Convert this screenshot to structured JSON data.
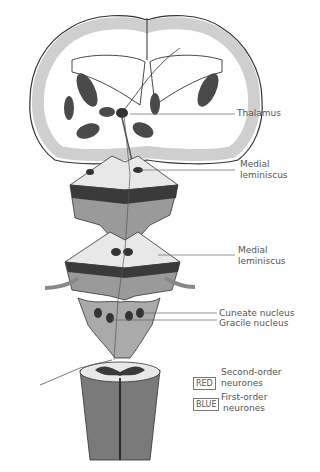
{
  "diagram": {
    "labels": {
      "thalamus": "Thalamus",
      "medial_lemniscus_upper": [
        "Medial",
        "leminiscus"
      ],
      "medial_lemniscus_lower": [
        "Medial",
        "leminiscus"
      ],
      "cuneate_nucleus": "Cuneate nucleus",
      "gracile_nucleus": "Gracile nucleus"
    },
    "key": [
      {
        "swatch": "RED",
        "text": [
          "Second-order",
          "neurones"
        ]
      },
      {
        "swatch": "BLUE",
        "text": [
          "First-order",
          "neurones"
        ]
      }
    ],
    "colors": {
      "cortex_gray": "#c8c8c8",
      "nuclei_dark": "#4a4a4a",
      "outline": "#333333",
      "label_text": "#555555"
    }
  }
}
